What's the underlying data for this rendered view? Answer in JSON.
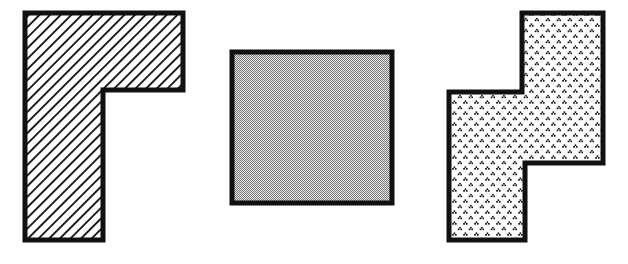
{
  "figure": {
    "background_color": "#ffffff",
    "canvas": {
      "width": 628,
      "height": 264
    },
    "outline_color": "#111111",
    "outline_width": 5,
    "shapes": [
      {
        "id": "shape-left",
        "name": "rotated-l-shape",
        "description": "L-shaped polygon rotated so the long arm points down and the short arm extends right at the top",
        "fill_style": "diagonal-hatch",
        "fill_color": "#ffffff",
        "pattern_color": "#1a1a1a",
        "pattern_angle_degrees": 45,
        "pattern_spacing": 7.5,
        "points": "25,13 183,13 183,90 103,90 103,240 25,240",
        "vertex_count": 6
      },
      {
        "id": "shape-middle",
        "name": "square-shape",
        "description": "Plain square with uniform gray stipple fill",
        "fill_style": "gray-checker-stipple",
        "fill_color": "#b3b3b3",
        "pattern_color": "#6e6e6e",
        "x": 232,
        "y": 52,
        "width": 160,
        "height": 151,
        "points": "232,52 392,52 392,203 232,203",
        "vertex_count": 4
      },
      {
        "id": "shape-right",
        "name": "z-step-shape",
        "description": "Z / S shaped stepped polygon with a speckled triangular dot fill",
        "fill_style": "triangle-dot-pattern",
        "fill_color": "#ffffff",
        "pattern_color": "#1a1a1a",
        "pattern_spacing": 11,
        "points": "522,13 603,13 603,163 525,163 525,240 449,240 449,92 522,92",
        "vertex_count": 8
      }
    ]
  }
}
